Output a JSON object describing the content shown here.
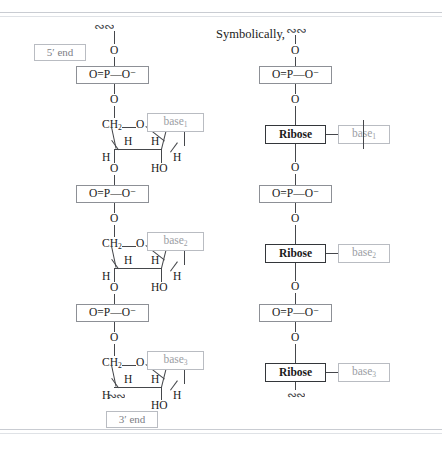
{
  "figure": {
    "heading": "Symbolically,",
    "end_labels": {
      "five_prime": "5′ end",
      "three_prime": "3′ end"
    },
    "atoms": {
      "oxygen": "O",
      "hydroxyl": "HO",
      "hydrogen": "H",
      "methylene": "CH",
      "methylene_sub": "2",
      "ribose": "Ribose"
    },
    "phosphate": {
      "left": "O",
      "double_bond": "=",
      "center": "P",
      "single_bond": "—",
      "right": "O",
      "charge": "−",
      "full": "O=P—O⁻"
    },
    "bases": [
      {
        "label": "base",
        "sub": "1"
      },
      {
        "label": "base",
        "sub": "2"
      },
      {
        "label": "base",
        "sub": "3"
      }
    ],
    "colors": {
      "ink": "#1a1a1a",
      "bond": "#45474b",
      "box_border": "#8d9096",
      "faint_box_border": "#b9bcc2",
      "faint_text": "#9b9ea4",
      "rule": "#c9ccd2",
      "background": "#ffffff"
    },
    "structure_note": {
      "left_column": "detailed ribose ring structure",
      "right_column": "symbolic Ribose box representation",
      "repeat_units": 3
    }
  }
}
